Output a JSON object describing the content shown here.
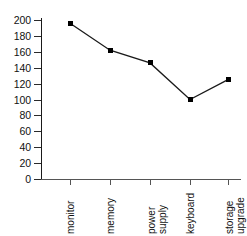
{
  "chart_data": {
    "type": "line",
    "title": "",
    "xlabel": "",
    "ylabel": "",
    "categories": [
      "monitor",
      "memory",
      "power supply",
      "keyboard",
      "storage upgrade"
    ],
    "category_lines": [
      [
        "monitor"
      ],
      [
        "memory"
      ],
      [
        "power",
        "supply"
      ],
      [
        "keyboard"
      ],
      [
        "storage",
        "upgrade"
      ]
    ],
    "values": [
      196,
      162,
      146,
      100,
      125
    ],
    "series": [
      {
        "name": "",
        "values": [
          196,
          162,
          146,
          100,
          125
        ]
      }
    ],
    "ylim": [
      0,
      200
    ],
    "ytick_values": [
      200,
      180,
      160,
      140,
      120,
      100,
      80,
      60,
      40,
      20,
      0
    ],
    "ytick_labels": [
      "200",
      "180",
      "160",
      "140",
      "120",
      "100",
      "80",
      "60",
      "40",
      "20",
      "0"
    ],
    "grid": false,
    "legend": false,
    "legend_position": "none",
    "marker": "square",
    "marker_color": "#000000",
    "line_color": "#1a1a1a",
    "background_color": "#ffffff",
    "axis_color": "#555555",
    "xtick_label_rotation": 90
  }
}
